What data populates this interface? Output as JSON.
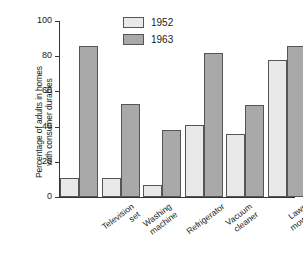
{
  "chart_data": {
    "type": "bar",
    "title": "",
    "xlabel": "",
    "ylabel": "Percentage of adults in homes\nwith consumer durables",
    "ylim": [
      0,
      100
    ],
    "yticks": [
      0,
      20,
      40,
      60,
      80,
      100
    ],
    "ytick_labels": [
      "0",
      "20",
      "40",
      "60",
      "80",
      "100"
    ],
    "grid": false,
    "legend_position": "top-center",
    "categories": [
      "Television\nset",
      "Washing\nmachine",
      "Refrigerator",
      "Vacuum\ncleaner",
      "Lawn mower",
      "Electric iron"
    ],
    "series": [
      {
        "name": "1952",
        "color": "#e9e9e9",
        "values": [
          11,
          11,
          7,
          41,
          36,
          78
        ]
      },
      {
        "name": "1963",
        "color": "#a9a9a9",
        "values": [
          86,
          53,
          38,
          82,
          52,
          86
        ]
      }
    ]
  },
  "legend": {
    "items": [
      {
        "label": "1952"
      },
      {
        "label": "1963"
      }
    ]
  }
}
